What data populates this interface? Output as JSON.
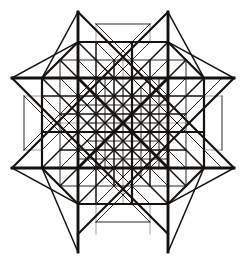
{
  "figure": {
    "caption": "",
    "background_color": "#ffffff",
    "ink_color": "#15120f",
    "faint_ink_color": "#8d8880",
    "canvas": {
      "width": 246,
      "height": 264
    },
    "grid": {
      "origin_x": 123,
      "origin_y": 132,
      "step": 18,
      "x_levels": [
        12,
        24,
        42,
        60,
        78,
        96,
        105,
        114,
        123,
        132,
        141,
        150,
        168,
        186,
        204,
        222,
        234
      ],
      "y_levels": [
        12,
        24,
        42,
        60,
        78,
        96,
        105,
        114,
        123,
        132,
        141,
        150,
        168,
        186,
        204,
        222,
        234,
        252
      ]
    },
    "star_points": [
      {
        "name": "top-left-spike",
        "x": 78,
        "y": 12
      },
      {
        "name": "top-right-spike",
        "x": 168,
        "y": 12
      },
      {
        "name": "right-upper-spike",
        "x": 234,
        "y": 78
      },
      {
        "name": "right-lower-spike",
        "x": 234,
        "y": 168
      },
      {
        "name": "bottom-right-spike",
        "x": 168,
        "y": 252
      },
      {
        "name": "bottom-left-spike",
        "x": 78,
        "y": 252
      },
      {
        "name": "left-lower-spike",
        "x": 12,
        "y": 168
      },
      {
        "name": "left-upper-spike",
        "x": 12,
        "y": 78
      }
    ],
    "octagon_hull": [
      {
        "x": 78,
        "y": 42
      },
      {
        "x": 168,
        "y": 42
      },
      {
        "x": 204,
        "y": 78
      },
      {
        "x": 204,
        "y": 168
      },
      {
        "x": 168,
        "y": 204
      },
      {
        "x": 78,
        "y": 204
      },
      {
        "x": 42,
        "y": 168
      },
      {
        "x": 42,
        "y": 78
      }
    ],
    "horizontal_rules": [
      {
        "y": 42,
        "x1": 78,
        "x2": 168,
        "weight": "med"
      },
      {
        "y": 60,
        "x1": 60,
        "x2": 186,
        "weight": "thin"
      },
      {
        "y": 78,
        "x1": 12,
        "x2": 234,
        "weight": "heavy"
      },
      {
        "y": 96,
        "x1": 42,
        "x2": 204,
        "weight": "med"
      },
      {
        "y": 105,
        "x1": 78,
        "x2": 168,
        "weight": "thin"
      },
      {
        "y": 114,
        "x1": 60,
        "x2": 186,
        "weight": "med"
      },
      {
        "y": 123,
        "x1": 87,
        "x2": 159,
        "weight": "thin"
      },
      {
        "y": 132,
        "x1": 42,
        "x2": 204,
        "weight": "thick"
      },
      {
        "y": 141,
        "x1": 87,
        "x2": 159,
        "weight": "thin"
      },
      {
        "y": 150,
        "x1": 60,
        "x2": 186,
        "weight": "med"
      },
      {
        "y": 159,
        "x1": 78,
        "x2": 168,
        "weight": "thin"
      },
      {
        "y": 168,
        "x1": 12,
        "x2": 234,
        "weight": "heavy"
      },
      {
        "y": 186,
        "x1": 60,
        "x2": 186,
        "weight": "thin"
      },
      {
        "y": 204,
        "x1": 78,
        "x2": 168,
        "weight": "med"
      },
      {
        "y": 24,
        "x1": 96,
        "x2": 150,
        "weight": "thin"
      },
      {
        "y": 222,
        "x1": 96,
        "x2": 150,
        "weight": "thin"
      }
    ],
    "vertical_rules": [
      {
        "x": 42,
        "y1": 78,
        "y2": 168,
        "weight": "med"
      },
      {
        "x": 60,
        "y1": 60,
        "y2": 186,
        "weight": "thin"
      },
      {
        "x": 78,
        "y1": 12,
        "y2": 252,
        "weight": "heavy"
      },
      {
        "x": 96,
        "y1": 42,
        "y2": 204,
        "weight": "med"
      },
      {
        "x": 105,
        "y1": 78,
        "y2": 168,
        "weight": "thin"
      },
      {
        "x": 114,
        "y1": 60,
        "y2": 186,
        "weight": "med"
      },
      {
        "x": 123,
        "y1": 87,
        "y2": 177,
        "weight": "thin"
      },
      {
        "x": 132,
        "y1": 42,
        "y2": 204,
        "weight": "thick"
      },
      {
        "x": 141,
        "y1": 87,
        "y2": 177,
        "weight": "thin"
      },
      {
        "x": 150,
        "y1": 60,
        "y2": 186,
        "weight": "med"
      },
      {
        "x": 159,
        "y1": 78,
        "y2": 168,
        "weight": "thin"
      },
      {
        "x": 168,
        "y1": 12,
        "y2": 252,
        "weight": "heavy"
      },
      {
        "x": 186,
        "y1": 60,
        "y2": 186,
        "weight": "thin"
      },
      {
        "x": 204,
        "y1": 78,
        "y2": 168,
        "weight": "med"
      },
      {
        "x": 24,
        "y1": 96,
        "y2": 150,
        "weight": "thin"
      },
      {
        "x": 222,
        "y1": 96,
        "y2": 150,
        "weight": "thin"
      }
    ],
    "diagonals_down_right": [
      {
        "x1": 12,
        "y1": 78,
        "x2": 168,
        "y2": 234,
        "weight": "thick"
      },
      {
        "x1": 78,
        "y1": 12,
        "x2": 234,
        "y2": 168,
        "weight": "thick"
      },
      {
        "x1": 42,
        "y1": 78,
        "x2": 168,
        "y2": 204,
        "weight": "med"
      },
      {
        "x1": 78,
        "y1": 42,
        "x2": 204,
        "y2": 168,
        "weight": "med"
      },
      {
        "x1": 60,
        "y1": 78,
        "x2": 168,
        "y2": 186,
        "weight": "thin"
      },
      {
        "x1": 78,
        "y1": 60,
        "x2": 186,
        "y2": 168,
        "weight": "thin"
      },
      {
        "x1": 78,
        "y1": 78,
        "x2": 168,
        "y2": 168,
        "weight": "heavy"
      },
      {
        "x1": 96,
        "y1": 78,
        "x2": 168,
        "y2": 150,
        "weight": "med"
      },
      {
        "x1": 78,
        "y1": 96,
        "x2": 150,
        "y2": 168,
        "weight": "med"
      },
      {
        "x1": 114,
        "y1": 78,
        "x2": 168,
        "y2": 132,
        "weight": "thin"
      },
      {
        "x1": 78,
        "y1": 114,
        "x2": 132,
        "y2": 168,
        "weight": "thin"
      },
      {
        "x1": 132,
        "y1": 78,
        "x2": 168,
        "y2": 114,
        "weight": "thin"
      },
      {
        "x1": 78,
        "y1": 132,
        "x2": 114,
        "y2": 168,
        "weight": "thin"
      },
      {
        "x1": 42,
        "y1": 96,
        "x2": 150,
        "y2": 204,
        "weight": "thin"
      },
      {
        "x1": 96,
        "y1": 42,
        "x2": 204,
        "y2": 150,
        "weight": "thin"
      },
      {
        "x1": 60,
        "y1": 60,
        "x2": 186,
        "y2": 186,
        "weight": "med"
      },
      {
        "x1": 96,
        "y1": 96,
        "x2": 150,
        "y2": 150,
        "weight": "med"
      },
      {
        "x1": 114,
        "y1": 96,
        "x2": 150,
        "y2": 132,
        "weight": "thin"
      },
      {
        "x1": 96,
        "y1": 114,
        "x2": 132,
        "y2": 150,
        "weight": "thin"
      },
      {
        "x1": 24,
        "y1": 96,
        "x2": 96,
        "y2": 168,
        "weight": "thin"
      },
      {
        "x1": 150,
        "y1": 96,
        "x2": 222,
        "y2": 168,
        "weight": "thin"
      },
      {
        "x1": 96,
        "y1": 24,
        "x2": 168,
        "y2": 96,
        "weight": "thin"
      },
      {
        "x1": 78,
        "y1": 150,
        "x2": 150,
        "y2": 222,
        "weight": "thin"
      },
      {
        "x1": 105,
        "y1": 105,
        "x2": 141,
        "y2": 141,
        "weight": "thin"
      },
      {
        "x1": 60,
        "y1": 114,
        "x2": 114,
        "y2": 168,
        "weight": "thin"
      },
      {
        "x1": 114,
        "y1": 60,
        "x2": 168,
        "y2": 114,
        "weight": "thin"
      },
      {
        "x1": 132,
        "y1": 96,
        "x2": 186,
        "y2": 150,
        "weight": "thin"
      },
      {
        "x1": 96,
        "y1": 132,
        "x2": 150,
        "y2": 186,
        "weight": "thin"
      }
    ],
    "diagonals_up_right": [
      {
        "x1": 12,
        "y1": 168,
        "x2": 168,
        "y2": 12,
        "weight": "thick"
      },
      {
        "x1": 78,
        "y1": 234,
        "x2": 234,
        "y2": 78,
        "weight": "thick"
      },
      {
        "x1": 42,
        "y1": 168,
        "x2": 168,
        "y2": 42,
        "weight": "med"
      },
      {
        "x1": 78,
        "y1": 204,
        "x2": 204,
        "y2": 78,
        "weight": "med"
      },
      {
        "x1": 60,
        "y1": 168,
        "x2": 168,
        "y2": 60,
        "weight": "thin"
      },
      {
        "x1": 78,
        "y1": 186,
        "x2": 186,
        "y2": 78,
        "weight": "thin"
      },
      {
        "x1": 78,
        "y1": 168,
        "x2": 168,
        "y2": 78,
        "weight": "heavy"
      },
      {
        "x1": 96,
        "y1": 168,
        "x2": 168,
        "y2": 96,
        "weight": "med"
      },
      {
        "x1": 78,
        "y1": 150,
        "x2": 150,
        "y2": 78,
        "weight": "med"
      },
      {
        "x1": 114,
        "y1": 168,
        "x2": 168,
        "y2": 114,
        "weight": "thin"
      },
      {
        "x1": 78,
        "y1": 132,
        "x2": 132,
        "y2": 78,
        "weight": "thin"
      },
      {
        "x1": 132,
        "y1": 168,
        "x2": 168,
        "y2": 132,
        "weight": "thin"
      },
      {
        "x1": 78,
        "y1": 114,
        "x2": 114,
        "y2": 78,
        "weight": "thin"
      },
      {
        "x1": 42,
        "y1": 150,
        "x2": 150,
        "y2": 42,
        "weight": "thin"
      },
      {
        "x1": 96,
        "y1": 204,
        "x2": 204,
        "y2": 96,
        "weight": "thin"
      },
      {
        "x1": 60,
        "y1": 186,
        "x2": 186,
        "y2": 60,
        "weight": "med"
      },
      {
        "x1": 96,
        "y1": 150,
        "x2": 150,
        "y2": 96,
        "weight": "med"
      },
      {
        "x1": 114,
        "y1": 150,
        "x2": 150,
        "y2": 114,
        "weight": "thin"
      },
      {
        "x1": 96,
        "y1": 132,
        "x2": 132,
        "y2": 96,
        "weight": "thin"
      },
      {
        "x1": 24,
        "y1": 150,
        "x2": 96,
        "y2": 78,
        "weight": "thin"
      },
      {
        "x1": 150,
        "y1": 150,
        "x2": 222,
        "y2": 78,
        "weight": "thin"
      },
      {
        "x1": 96,
        "y1": 222,
        "x2": 168,
        "y2": 150,
        "weight": "thin"
      },
      {
        "x1": 78,
        "y1": 96,
        "x2": 150,
        "y2": 24,
        "weight": "thin"
      },
      {
        "x1": 105,
        "y1": 141,
        "x2": 141,
        "y2": 105,
        "weight": "thin"
      },
      {
        "x1": 60,
        "y1": 132,
        "x2": 114,
        "y2": 78,
        "weight": "thin"
      },
      {
        "x1": 114,
        "y1": 186,
        "x2": 168,
        "y2": 132,
        "weight": "thin"
      },
      {
        "x1": 132,
        "y1": 150,
        "x2": 186,
        "y2": 96,
        "weight": "thin"
      },
      {
        "x1": 96,
        "y1": 114,
        "x2": 150,
        "y2": 60,
        "weight": "thin"
      }
    ],
    "spike_edges": [
      {
        "x1": 78,
        "y1": 12,
        "x2": 42,
        "y2": 78,
        "weight": "med"
      },
      {
        "x1": 78,
        "y1": 12,
        "x2": 78,
        "y2": 78,
        "weight": "med"
      },
      {
        "x1": 168,
        "y1": 12,
        "x2": 204,
        "y2": 78,
        "weight": "med"
      },
      {
        "x1": 168,
        "y1": 12,
        "x2": 168,
        "y2": 78,
        "weight": "med"
      },
      {
        "x1": 234,
        "y1": 78,
        "x2": 168,
        "y2": 42,
        "weight": "med"
      },
      {
        "x1": 234,
        "y1": 78,
        "x2": 168,
        "y2": 78,
        "weight": "med"
      },
      {
        "x1": 234,
        "y1": 168,
        "x2": 168,
        "y2": 204,
        "weight": "med"
      },
      {
        "x1": 234,
        "y1": 168,
        "x2": 168,
        "y2": 168,
        "weight": "med"
      },
      {
        "x1": 168,
        "y1": 252,
        "x2": 204,
        "y2": 168,
        "weight": "med"
      },
      {
        "x1": 168,
        "y1": 252,
        "x2": 168,
        "y2": 168,
        "weight": "med"
      },
      {
        "x1": 78,
        "y1": 252,
        "x2": 42,
        "y2": 168,
        "weight": "med"
      },
      {
        "x1": 78,
        "y1": 252,
        "x2": 78,
        "y2": 168,
        "weight": "med"
      },
      {
        "x1": 12,
        "y1": 168,
        "x2": 78,
        "y2": 204,
        "weight": "med"
      },
      {
        "x1": 12,
        "y1": 168,
        "x2": 78,
        "y2": 168,
        "weight": "med"
      },
      {
        "x1": 12,
        "y1": 78,
        "x2": 78,
        "y2": 42,
        "weight": "med"
      },
      {
        "x1": 12,
        "y1": 78,
        "x2": 78,
        "y2": 78,
        "weight": "med"
      }
    ],
    "faint_rules": [
      {
        "kind": "v",
        "x": 123,
        "y1": 60,
        "y2": 96
      },
      {
        "kind": "v",
        "x": 123,
        "y1": 168,
        "y2": 204
      },
      {
        "kind": "h",
        "y": 123,
        "x1": 60,
        "x2": 96
      },
      {
        "kind": "h",
        "y": 123,
        "x1": 150,
        "x2": 186
      },
      {
        "kind": "v",
        "x": 96,
        "y1": 204,
        "y2": 234
      },
      {
        "kind": "v",
        "x": 150,
        "y1": 204,
        "y2": 234
      },
      {
        "kind": "v",
        "x": 96,
        "y1": 24,
        "y2": 42
      },
      {
        "kind": "v",
        "x": 150,
        "y1": 24,
        "y2": 42
      },
      {
        "kind": "h",
        "y": 96,
        "x1": 24,
        "x2": 42
      },
      {
        "kind": "h",
        "y": 150,
        "x1": 24,
        "x2": 42
      },
      {
        "kind": "h",
        "y": 96,
        "x1": 204,
        "x2": 222
      },
      {
        "kind": "h",
        "y": 150,
        "x1": 204,
        "x2": 222
      }
    ]
  }
}
